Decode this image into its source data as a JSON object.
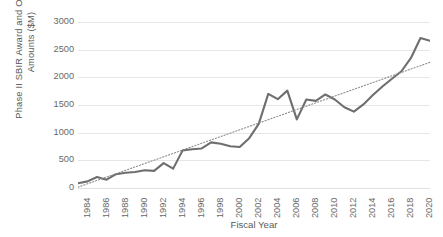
{
  "chart_data": {
    "type": "line",
    "title": "",
    "xlabel": "Fiscal Year",
    "ylabel": "Phase II SBIR Award and Obligated Amounts ($M)",
    "ylabel_line1": "Phase II SBIR Award and Obligated",
    "ylabel_line2": "Amounts ($M)",
    "ylim": [
      0,
      3000
    ],
    "ytick_values": [
      3000,
      2500,
      2000,
      1500,
      1000,
      500,
      0
    ],
    "ytick_labels": [
      "3000",
      "2500",
      "2000",
      "1500",
      "1000",
      "500",
      "0"
    ],
    "xlim": [
      1984,
      2021
    ],
    "xtick_labels": [
      "1984",
      "1986",
      "1988",
      "1990",
      "1992",
      "1994",
      "1996",
      "1998",
      "2000",
      "2002",
      "2004",
      "2006",
      "2008",
      "2010",
      "2012",
      "2014",
      "2016",
      "2018",
      "2020"
    ],
    "xtick_values": [
      1984,
      1986,
      1988,
      1990,
      1992,
      1994,
      1996,
      1998,
      2000,
      2002,
      2004,
      2006,
      2008,
      2010,
      2012,
      2014,
      2016,
      2018,
      2020
    ],
    "grid": true,
    "grid_axis": "y",
    "legend": false,
    "legend_position": "none",
    "x": [
      1984,
      1985,
      1986,
      1987,
      1988,
      1989,
      1990,
      1991,
      1992,
      1993,
      1994,
      1995,
      1996,
      1997,
      1998,
      1999,
      2000,
      2001,
      2002,
      2003,
      2004,
      2005,
      2006,
      2007,
      2008,
      2009,
      2010,
      2011,
      2012,
      2013,
      2014,
      2015,
      2016,
      2017,
      2018,
      2019,
      2020,
      2021
    ],
    "series": [
      {
        "name": "Phase II SBIR Award and Obligated Amounts",
        "style": "solid",
        "color": "#6e6e6e",
        "values": [
          85,
          120,
          200,
          150,
          250,
          275,
          290,
          320,
          310,
          450,
          350,
          680,
          700,
          715,
          825,
          800,
          755,
          740,
          900,
          1160,
          1700,
          1605,
          1760,
          1240,
          1600,
          1575,
          1690,
          1600,
          1460,
          1380,
          1510,
          1680,
          1835,
          1975,
          2110,
          2350,
          2710,
          2660
        ]
      },
      {
        "name": "Linear trendline",
        "style": "dotted",
        "color": "#8c8c8c",
        "values": [
          15,
          76,
          137,
          198,
          259,
          320,
          381,
          442,
          503,
          564,
          625,
          686,
          747,
          808,
          869,
          930,
          991,
          1052,
          1113,
          1174,
          1235,
          1296,
          1357,
          1418,
          1479,
          1540,
          1601,
          1662,
          1723,
          1784,
          1845,
          1906,
          1967,
          2028,
          2089,
          2150,
          2211,
          2272
        ]
      }
    ]
  }
}
